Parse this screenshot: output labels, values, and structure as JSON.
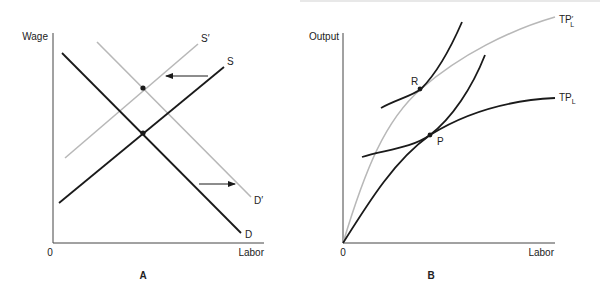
{
  "panel_a": {
    "y_axis_label": "Wage",
    "x_axis_label": "Labor",
    "origin_label": "0",
    "panel_label": "A",
    "curves": {
      "S": "S",
      "S_prime": "S′",
      "D": "D",
      "D_prime": "D′"
    },
    "shifts": {
      "supply": "left",
      "demand": "right"
    }
  },
  "panel_b": {
    "y_axis_label": "Output",
    "x_axis_label": "Labor",
    "origin_label": "0",
    "panel_label": "B",
    "curves": {
      "TP_L": "TP",
      "TP_L_sub": "L",
      "TP_L_prime": "TP",
      "TP_L_prime_sub": "L",
      "TP_L_prime_mark": "′"
    },
    "points": {
      "R": "R",
      "P": "P"
    }
  },
  "colors": {
    "primary_line": "#1a1a1a",
    "shifted_line": "#b8b8b8",
    "axis": "#444444"
  }
}
